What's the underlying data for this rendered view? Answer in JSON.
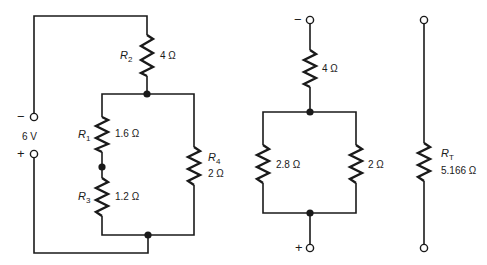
{
  "circuit_a": {
    "source": {
      "voltage": "6 V",
      "minus": "−",
      "plus": "+"
    },
    "r2": {
      "name": "R",
      "sub": "2",
      "value": "4 Ω"
    },
    "r1": {
      "name": "R",
      "sub": "1",
      "value": "1.6 Ω"
    },
    "r3": {
      "name": "R",
      "sub": "3",
      "value": "1.2 Ω"
    },
    "r4": {
      "name": "R",
      "sub": "4",
      "value": "2 Ω"
    }
  },
  "circuit_b": {
    "minus": "−",
    "plus": "+",
    "top": {
      "value": "4 Ω"
    },
    "left": {
      "value": "2.8 Ω"
    },
    "right": {
      "value": "2 Ω"
    }
  },
  "circuit_c": {
    "rt": {
      "name": "R",
      "sub": "T",
      "value": "5.166 Ω"
    }
  }
}
